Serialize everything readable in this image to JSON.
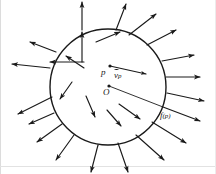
{
  "figure": {
    "kind": "vector-field-on-circle-diagram",
    "background_color": "#ffffff",
    "ink_color": "#1a1a1a",
    "width": 216,
    "height": 174,
    "border": {
      "visible_edges": [
        "left",
        "bottom"
      ],
      "color": "#d8d8d8"
    },
    "circle": {
      "cx": 108,
      "cy": 87,
      "r": 58,
      "stroke_width": 1.4,
      "fill": "none"
    },
    "labels": {
      "point_p": "p",
      "vector_vp_base": "v",
      "vector_vp_subscript": "p",
      "origin_O": "O",
      "image_f_name": "f",
      "image_f_open": "(",
      "image_f_arg": "p",
      "image_f_close": ")"
    },
    "points": [
      {
        "name": "p",
        "x": 110,
        "y": 66,
        "r": 1.6
      },
      {
        "name": "origin",
        "x": 109,
        "y": 86,
        "r": 1.6
      }
    ],
    "radius_line": {
      "name": "O-to-f(p)",
      "x1": 109,
      "y1": 86,
      "x2": 163,
      "y2": 107
    },
    "tangent_vector": {
      "name": "v_p",
      "x1": 110,
      "y1": 66,
      "x2": 146,
      "y2": 74
    },
    "interior_arrows": [
      {
        "x1": 84,
        "y1": 68,
        "x2": 66,
        "y2": 56
      },
      {
        "x1": 84,
        "y1": 62,
        "x2": 50,
        "y2": 62
      },
      {
        "x1": 82,
        "y1": 62,
        "x2": 82,
        "y2": 32
      },
      {
        "x1": 96,
        "y1": 42,
        "x2": 120,
        "y2": 32
      },
      {
        "x1": 72,
        "y1": 82,
        "x2": 60,
        "y2": 99
      },
      {
        "x1": 86,
        "y1": 96,
        "x2": 95,
        "y2": 117
      },
      {
        "x1": 107,
        "y1": 110,
        "x2": 121,
        "y2": 126
      },
      {
        "x1": 119,
        "y1": 104,
        "x2": 140,
        "y2": 119
      }
    ],
    "exterior_arrows": [
      {
        "x1": 116,
        "y1": 30,
        "x2": 126,
        "y2": 4
      },
      {
        "x1": 82,
        "y1": 30,
        "x2": 82,
        "y2": 2
      },
      {
        "x1": 129,
        "y1": 35,
        "x2": 156,
        "y2": 14
      },
      {
        "x1": 147,
        "y1": 45,
        "x2": 176,
        "y2": 30
      },
      {
        "x1": 162,
        "y1": 61,
        "x2": 194,
        "y2": 55
      },
      {
        "x1": 166,
        "y1": 77,
        "x2": 200,
        "y2": 77
      },
      {
        "x1": 167,
        "y1": 93,
        "x2": 204,
        "y2": 101
      },
      {
        "x1": 163,
        "y1": 107,
        "x2": 200,
        "y2": 121
      },
      {
        "x1": 152,
        "y1": 122,
        "x2": 186,
        "y2": 143
      },
      {
        "x1": 136,
        "y1": 135,
        "x2": 164,
        "y2": 160
      },
      {
        "x1": 118,
        "y1": 143,
        "x2": 128,
        "y2": 172
      },
      {
        "x1": 98,
        "y1": 145,
        "x2": 91,
        "y2": 172
      },
      {
        "x1": 74,
        "y1": 135,
        "x2": 56,
        "y2": 160
      },
      {
        "x1": 62,
        "y1": 124,
        "x2": 37,
        "y2": 142
      },
      {
        "x1": 54,
        "y1": 113,
        "x2": 29,
        "y2": 124
      },
      {
        "x1": 50,
        "y1": 68,
        "x2": 12,
        "y2": 64
      },
      {
        "x1": 56,
        "y1": 52,
        "x2": 30,
        "y2": 42
      },
      {
        "x1": 52,
        "y1": 97,
        "x2": 18,
        "y2": 114
      }
    ]
  }
}
